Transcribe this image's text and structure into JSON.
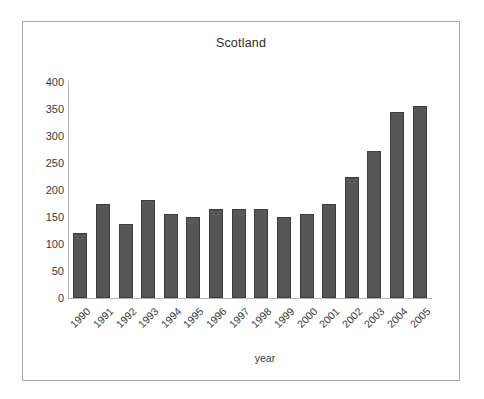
{
  "chart_data": {
    "type": "bar",
    "title": "Scotland",
    "xlabel": "year",
    "ylabel": "",
    "categories": [
      "1990",
      "1991",
      "1992",
      "1993",
      "1994",
      "1995",
      "1996",
      "1997",
      "1998",
      "1999",
      "2000",
      "2001",
      "2002",
      "2003",
      "2004",
      "2005"
    ],
    "values": [
      120,
      175,
      137,
      181,
      156,
      150,
      165,
      165,
      165,
      150,
      155,
      175,
      225,
      273,
      345,
      355
    ],
    "ylim": [
      0,
      400
    ],
    "yticks": [
      0,
      50,
      100,
      150,
      200,
      250,
      300,
      350,
      400
    ],
    "ytick_labels": [
      "0",
      "50",
      "100",
      "150",
      "200",
      "250",
      "300",
      "350",
      "400"
    ],
    "grid": false,
    "legend": false,
    "bar_color": "#565656",
    "bar_edge_color": "#3d3d3d",
    "axis_color": "#b4b4b4",
    "frame_color": "#a8a8a8",
    "background": "#ffffff"
  }
}
